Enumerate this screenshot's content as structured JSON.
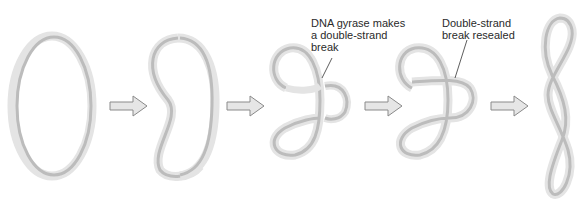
{
  "diagram": {
    "stages": [
      {
        "id": "relaxed-circle",
        "step": 1
      },
      {
        "id": "writhed-loop",
        "step": 2
      },
      {
        "id": "double-strand-break",
        "step": 3
      },
      {
        "id": "break-resealed",
        "step": 4
      },
      {
        "id": "supercoiled",
        "step": 5
      }
    ],
    "labels": {
      "break": {
        "lines": [
          "DNA gyrase makes",
          "a double-strand",
          "break"
        ]
      },
      "reseal": {
        "lines": [
          "Double-strand",
          "break resealed"
        ]
      }
    },
    "colors": {
      "ribbon_light": "#e2e2e2",
      "ribbon_dark": "#b8b8b8",
      "arrow_fill": "#e6e6e6",
      "arrow_stroke": "#8a8a8a",
      "text": "#2a2a2a"
    }
  }
}
